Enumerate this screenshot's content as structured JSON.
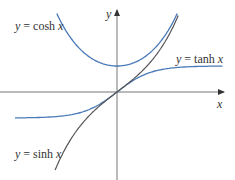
{
  "chart_data": {
    "type": "line",
    "title": "",
    "xlabel": "x",
    "ylabel": "y",
    "grid": false,
    "legend_position": "inline labels",
    "xlim": [
      -3.4,
      3.1
    ],
    "ylim": [
      -3.4,
      3.5
    ],
    "series": [
      {
        "name": "y = cosh x",
        "function": "cosh",
        "color": "#4a7ab8",
        "x": [
          -1.77,
          -1.5,
          -1,
          -0.5,
          0,
          0.5,
          1,
          1.5,
          1.77
        ],
        "y": [
          3.02,
          2.35,
          1.54,
          1.13,
          1.0,
          1.13,
          1.54,
          2.35,
          3.02
        ]
      },
      {
        "name": "y = tanh x",
        "function": "tanh",
        "color": "#4a7ab8",
        "x": [
          -3.0,
          -2,
          -1,
          -0.5,
          0,
          0.5,
          1,
          2,
          3.1
        ],
        "y": [
          -0.995,
          -0.96,
          -0.76,
          -0.46,
          0,
          0.46,
          0.76,
          0.96,
          0.996
        ]
      },
      {
        "name": "y = sinh x",
        "function": "sinh",
        "color": "#555555",
        "x": [
          -1.82,
          -1.5,
          -1,
          -0.5,
          0,
          0.5,
          1,
          1.5,
          1.8
        ],
        "y": [
          -2.99,
          -2.13,
          -1.18,
          -0.52,
          0,
          0.52,
          1.18,
          2.13,
          2.94
        ]
      }
    ],
    "annotations": [
      "y = cosh x",
      "y = tanh x",
      "y = sinh x"
    ]
  },
  "labels": {
    "cosh": {
      "y": "y",
      "eq": " = cosh ",
      "x": "x"
    },
    "tanh": {
      "y": "y",
      "eq": " = tanh ",
      "x": "x"
    },
    "sinh": {
      "y": "y",
      "eq": " = sinh ",
      "x": "x"
    },
    "x_axis": "x",
    "y_axis": "y"
  },
  "colors": {
    "curve_blue": "#4a7ab8",
    "curve_dark": "#555555",
    "axis": "#777777"
  }
}
